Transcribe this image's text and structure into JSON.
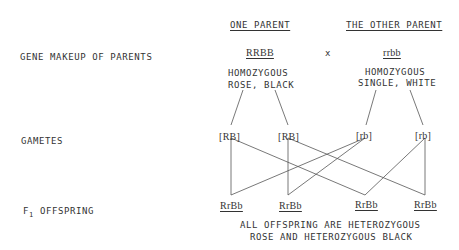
{
  "headers": {
    "one_parent": "ONE PARENT",
    "other_parent": "THE OTHER PARENT"
  },
  "row_labels": {
    "gene_makeup": "GENE MAKEUP OF PARENTS",
    "gametes": "GAMETES",
    "f1_prefix": "F",
    "f1_sub": "1",
    "f1_suffix": " OFFSPRING"
  },
  "parents": {
    "one": {
      "genotype": "RRBB",
      "desc_line1": "HOMOZYGOUS",
      "desc_line2": "ROSE, BLACK"
    },
    "cross_symbol": "x",
    "other": {
      "genotype": "rrbb",
      "desc_line1": "HOMOZYGOUS",
      "desc_line2": "SINGLE, WHITE"
    }
  },
  "gametes": [
    "[RB]",
    "[RB]",
    "[rb]",
    "[rb]"
  ],
  "offspring": [
    "RrBb",
    "RrBb",
    "RrBb",
    "RrBb"
  ],
  "conclusion": {
    "line1": "ALL OFFSPRING ARE HETEROZYGOUS",
    "line2": "ROSE AND HETEROZYGOUS BLACK"
  }
}
